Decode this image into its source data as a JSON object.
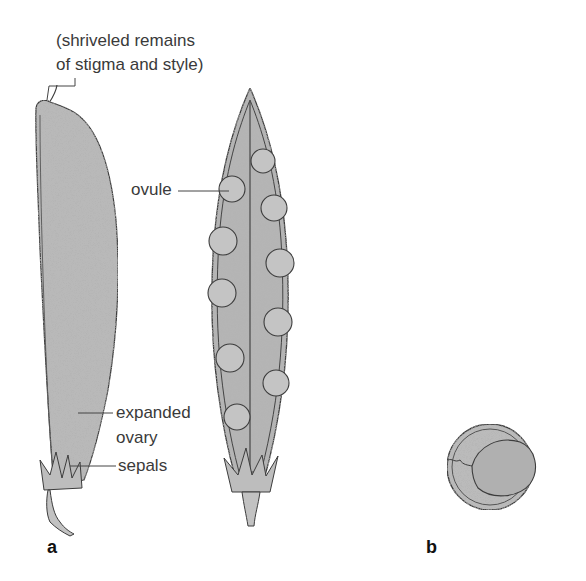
{
  "figure": {
    "colors": {
      "background": "#ffffff",
      "tissue_fill": "#b9b9b9",
      "ovule_fill": "#c4c4c4",
      "outline": "#3c3c3c",
      "label_text": "#3a3a3a",
      "leader_line": "#444444"
    },
    "panel_a": {
      "letter": "a",
      "labels": {
        "stigma_line1": "(shriveled remains",
        "stigma_line2": "of stigma and style)",
        "ovule": "ovule",
        "expanded_line1": "expanded",
        "expanded_line2": "ovary",
        "sepals": "sepals"
      }
    },
    "panel_b": {
      "letter": "b"
    }
  }
}
